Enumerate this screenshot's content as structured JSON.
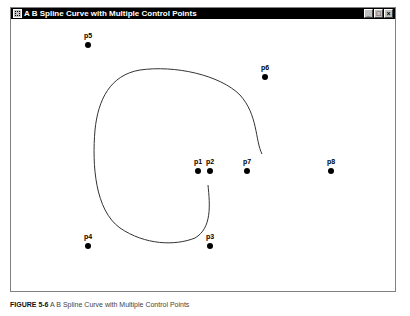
{
  "window": {
    "title": "A B Spline Curve with Multiple Control Points",
    "controls": {
      "minimize": "_",
      "maximize": "□",
      "close": "×"
    }
  },
  "control_points": [
    {
      "label": "p1",
      "x": 198,
      "y": 171
    },
    {
      "label": "p2",
      "x": 210,
      "y": 171
    },
    {
      "label": "p3",
      "x": 210,
      "y": 246
    },
    {
      "label": "p4",
      "x": 88,
      "y": 246
    },
    {
      "label": "p5",
      "x": 88,
      "y": 45
    },
    {
      "label": "p6",
      "x": 265,
      "y": 77
    },
    {
      "label": "p7",
      "x": 247,
      "y": 171
    },
    {
      "label": "p8",
      "x": 331,
      "y": 171
    }
  ],
  "curve": {
    "color": "#333333",
    "path": "M262 154 C255 140 258 115 240 95 C220 75 175 65 140 70 C110 75 98 100 95 130 C92 165 95 210 120 228 C145 245 175 246 195 238 C212 228 210 205 208 185"
  },
  "caption": {
    "prefix": "FIGURE 5-6",
    "text": "A B Spline Curve with Multiple Control Points"
  }
}
